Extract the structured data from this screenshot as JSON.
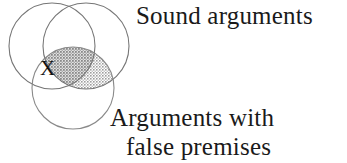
{
  "figure": {
    "type": "venn-diagram",
    "circle_count": 3,
    "background_color": "#ffffff",
    "stroke_color": "#6e6e6e",
    "shade_color": "#b9b9b9",
    "shade_dark_color": "#9a9a9a",
    "text_color": "#1a1a1a"
  },
  "labels": {
    "sound": "Sound arguments",
    "false_premises_line1": "Arguments with",
    "false_premises_line2": "false premises",
    "x_mark": "X"
  },
  "circles": [
    {
      "name": "left-circle",
      "cx": 52,
      "cy": 46,
      "r": 43
    },
    {
      "name": "right-circle",
      "cx": 86,
      "cy": 46,
      "r": 43
    },
    {
      "name": "bottom-circle",
      "cx": 73,
      "cy": 88,
      "r": 41
    }
  ],
  "regions": {
    "shaded": "right-circle ∩ bottom-circle",
    "shaded_dark": "left-circle ∩ right-circle ∩ bottom-circle",
    "x_region": "left-circle ∩ bottom-circle, outside right-circle"
  }
}
